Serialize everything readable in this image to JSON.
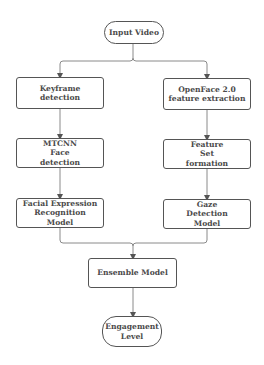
{
  "diagram": {
    "type": "flowchart",
    "colors": {
      "stroke": "#555555",
      "edge": "#8a8a8a",
      "text": "#4a4a4a",
      "background": "#ffffff"
    },
    "nodes": [
      {
        "id": "input",
        "label": "Input Video",
        "shape": "terminal"
      },
      {
        "id": "keyframe",
        "label": "Keyframe detection",
        "shape": "process"
      },
      {
        "id": "openface",
        "label": "OpenFace 2.0 feature extraction",
        "shape": "process"
      },
      {
        "id": "mtcnn",
        "label": "MTCNN Face detection",
        "shape": "process"
      },
      {
        "id": "featureset",
        "label": "Feature Set formation",
        "shape": "process"
      },
      {
        "id": "fer",
        "label": "Facial Expression Recognition Model",
        "shape": "process"
      },
      {
        "id": "gaze",
        "label": "Gaze  Detection Model",
        "shape": "process"
      },
      {
        "id": "ensemble",
        "label": "Ensemble Model",
        "shape": "process"
      },
      {
        "id": "engagement",
        "label": "Engagement Level",
        "shape": "terminal"
      }
    ],
    "edges": [
      {
        "from": "input",
        "to": "keyframe"
      },
      {
        "from": "input",
        "to": "openface"
      },
      {
        "from": "keyframe",
        "to": "mtcnn"
      },
      {
        "from": "mtcnn",
        "to": "fer"
      },
      {
        "from": "openface",
        "to": "featureset"
      },
      {
        "from": "featureset",
        "to": "gaze"
      },
      {
        "from": "fer",
        "to": "ensemble"
      },
      {
        "from": "gaze",
        "to": "ensemble"
      },
      {
        "from": "ensemble",
        "to": "engagement"
      }
    ]
  }
}
